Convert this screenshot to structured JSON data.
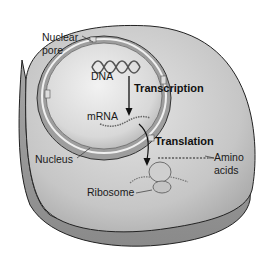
{
  "diagram": {
    "type": "cell-gene-expression",
    "labels": {
      "nuclear_pore_line1": "Nuclear",
      "nuclear_pore_line2": "pore",
      "dna": "DNA",
      "transcription": "Transcription",
      "mrna": "mRNA",
      "translation": "Translation",
      "nucleus": "Nucleus",
      "amino_line1": "Amino",
      "amino_line2": "acids",
      "ribosome": "Ribosome"
    },
    "colors": {
      "cell_top": "#c8c8c8",
      "cell_side": "#9a9a9a",
      "nucleus_inner": "#dedede",
      "outline": "#222222"
    }
  }
}
